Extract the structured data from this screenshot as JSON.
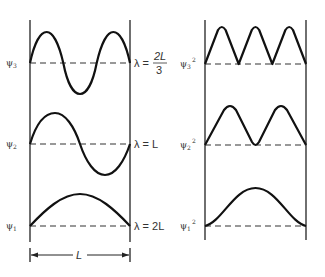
{
  "diagram": {
    "left_panel": {
      "description": "Wavefunctions psi_n",
      "states": [
        {
          "label_main": "ψ",
          "label_sub": "3",
          "wavelength_text": "λ =",
          "wavelength_num": "2L",
          "wavelength_den": "3",
          "half_waves": 3
        },
        {
          "label_main": "ψ",
          "label_sub": "2",
          "wavelength_text": "λ = L",
          "half_waves": 2
        },
        {
          "label_main": "ψ",
          "label_sub": "1",
          "wavelength_text": "λ = 2L",
          "half_waves": 1
        }
      ],
      "width_label": "L"
    },
    "right_panel": {
      "description": "Probability densities psi_n squared",
      "states": [
        {
          "label_main": "ψ",
          "label_sub": "3",
          "label_sup": "2",
          "humps": 3
        },
        {
          "label_main": "ψ",
          "label_sub": "2",
          "label_sup": "2",
          "humps": 2
        },
        {
          "label_main": "ψ",
          "label_sub": "1",
          "label_sup": "2",
          "humps": 1
        }
      ]
    },
    "colors": {
      "line": "#111111",
      "baseline": "#333333",
      "background": "#ffffff"
    }
  }
}
